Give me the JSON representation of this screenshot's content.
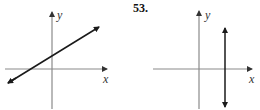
{
  "figures": [
    {
      "id": "left",
      "number": "",
      "x_axis_label": "x",
      "y_axis_label": "y",
      "line": "slanted line with positive slope, crossing x-axis left of origin and y-axis above origin"
    },
    {
      "id": "right",
      "number": "53.",
      "x_axis_label": "x",
      "y_axis_label": "y",
      "line": "vertical line to the right of the y-axis"
    }
  ],
  "colors": {
    "axis": "#8a8a8a",
    "line": "#1a1a1a"
  }
}
